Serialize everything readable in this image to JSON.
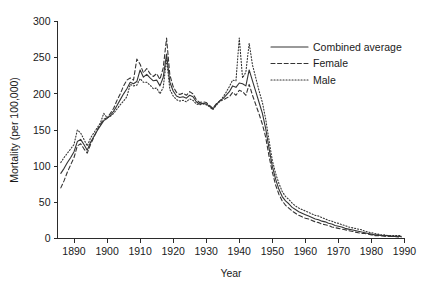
{
  "chart_data": {
    "type": "line",
    "title": "",
    "subtitle": "",
    "xlabel": "Year",
    "ylabel": "Mortality (per 100,000)",
    "xlim": [
      1885,
      1990
    ],
    "ylim": [
      0,
      300
    ],
    "xticks": [
      1890,
      1900,
      1910,
      1920,
      1930,
      1940,
      1950,
      1960,
      1970,
      1980,
      1990
    ],
    "xtick_labels": [
      "1890",
      "1900",
      "1910",
      "1920",
      "1930",
      "1940",
      "1950",
      "1960",
      "1970",
      "1980",
      "1990"
    ],
    "yticks": [
      0,
      50,
      100,
      150,
      200,
      250,
      300
    ],
    "ytick_labels": [
      "0",
      "50",
      "100",
      "150",
      "200",
      "250",
      "300"
    ],
    "grid": false,
    "legend_position": "top-right",
    "line_color": "#343434",
    "x": [
      1886,
      1887,
      1888,
      1889,
      1890,
      1891,
      1892,
      1893,
      1894,
      1895,
      1896,
      1897,
      1898,
      1899,
      1900,
      1901,
      1902,
      1903,
      1904,
      1905,
      1906,
      1907,
      1908,
      1909,
      1910,
      1911,
      1912,
      1913,
      1914,
      1915,
      1916,
      1917,
      1918,
      1919,
      1920,
      1921,
      1922,
      1923,
      1924,
      1925,
      1926,
      1927,
      1928,
      1929,
      1930,
      1931,
      1932,
      1933,
      1934,
      1935,
      1936,
      1937,
      1938,
      1939,
      1940,
      1941,
      1942,
      1943,
      1944,
      1945,
      1946,
      1947,
      1948,
      1949,
      1950,
      1951,
      1952,
      1953,
      1954,
      1955,
      1956,
      1957,
      1958,
      1959,
      1960,
      1961,
      1962,
      1963,
      1964,
      1965,
      1966,
      1967,
      1968,
      1969,
      1970,
      1971,
      1972,
      1973,
      1974,
      1975,
      1976,
      1977,
      1978,
      1979,
      1980,
      1981,
      1982,
      1983,
      1984,
      1985,
      1986,
      1987,
      1988,
      1989
    ],
    "series": [
      {
        "name": "Combined average",
        "style": "solid",
        "values": [
          90,
          97,
          105,
          112,
          120,
          134,
          137,
          130,
          122,
          133,
          141,
          149,
          156,
          163,
          166,
          170,
          176,
          184,
          192,
          200,
          207,
          216,
          214,
          217,
          233,
          223,
          227,
          222,
          218,
          219,
          211,
          223,
          255,
          216,
          204,
          197,
          195,
          196,
          194,
          198,
          196,
          189,
          186,
          187,
          186,
          183,
          179,
          185,
          190,
          193,
          198,
          203,
          211,
          209,
          215,
          214,
          211,
          233,
          218,
          203,
          188,
          173,
          152,
          125,
          100,
          82,
          68,
          58,
          52,
          48,
          43,
          40,
          37,
          35,
          33,
          31,
          29,
          27,
          26,
          24,
          23,
          21,
          20,
          18,
          17,
          16,
          14,
          13,
          12,
          11,
          10,
          9,
          8,
          7,
          6,
          5,
          5,
          4,
          4,
          4,
          3,
          3,
          3,
          3
        ]
      },
      {
        "name": "Female",
        "style": "dashed",
        "values": [
          70,
          80,
          92,
          102,
          112,
          128,
          131,
          124,
          118,
          130,
          140,
          150,
          158,
          165,
          167,
          173,
          180,
          191,
          200,
          211,
          219,
          222,
          219,
          248,
          241,
          229,
          235,
          228,
          224,
          228,
          220,
          236,
          277,
          226,
          210,
          202,
          199,
          201,
          198,
          203,
          200,
          192,
          188,
          189,
          188,
          184,
          180,
          186,
          190,
          191,
          194,
          196,
          202,
          198,
          205,
          203,
          198,
          213,
          198,
          185,
          172,
          158,
          140,
          114,
          92,
          74,
          61,
          52,
          46,
          42,
          38,
          35,
          32,
          30,
          28,
          27,
          25,
          23,
          22,
          20,
          19,
          18,
          16,
          15,
          14,
          13,
          12,
          11,
          10,
          9,
          8,
          7,
          7,
          6,
          5,
          4,
          4,
          4,
          3,
          3,
          3,
          3,
          2,
          2
        ]
      },
      {
        "name": "Male",
        "style": "dotted",
        "values": [
          105,
          112,
          118,
          124,
          130,
          150,
          146,
          137,
          128,
          139,
          146,
          153,
          160,
          173,
          167,
          169,
          173,
          179,
          185,
          190,
          196,
          213,
          211,
          212,
          221,
          216,
          216,
          212,
          207,
          208,
          200,
          209,
          248,
          206,
          197,
          192,
          190,
          191,
          189,
          193,
          191,
          186,
          185,
          186,
          185,
          182,
          178,
          184,
          189,
          195,
          202,
          210,
          219,
          218,
          277,
          222,
          230,
          270,
          240,
          222,
          204,
          188,
          165,
          136,
          108,
          90,
          76,
          65,
          58,
          54,
          49,
          45,
          42,
          40,
          38,
          36,
          34,
          32,
          31,
          29,
          27,
          25,
          24,
          22,
          21,
          19,
          18,
          16,
          15,
          14,
          13,
          12,
          10,
          9,
          8,
          7,
          6,
          5,
          5,
          4,
          4,
          4,
          4,
          4
        ]
      }
    ],
    "legend": [
      {
        "label": "Combined average",
        "style": "solid"
      },
      {
        "label": "Female",
        "style": "dashed"
      },
      {
        "label": "Male",
        "style": "dotted"
      }
    ]
  }
}
